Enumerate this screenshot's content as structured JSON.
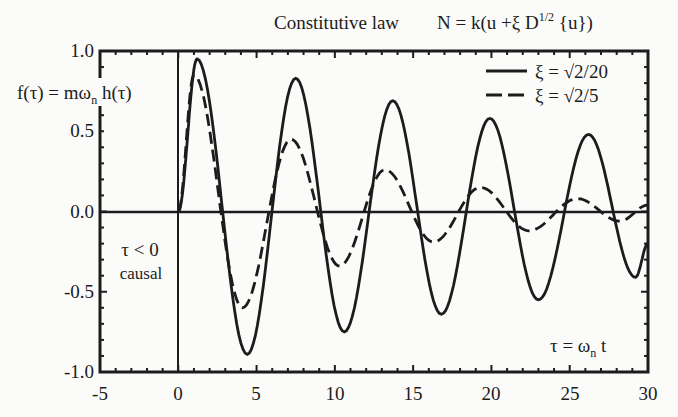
{
  "chart_data": {
    "type": "line",
    "title": "Constitutive law",
    "equation": "N = k(u + ξ D^{1/2}{u})",
    "xlabel": "τ = ω_n t",
    "ylabel": "f(τ) = m ω_n h(τ)",
    "xlim": [
      -5,
      30
    ],
    "ylim": [
      -1.0,
      1.0
    ],
    "x_ticks": [
      "-5",
      "0",
      "5",
      "10",
      "15",
      "20",
      "25",
      "30"
    ],
    "y_ticks": [
      "1.0",
      "0.5",
      "0.0",
      "-0.5",
      "-1.0"
    ],
    "grid": false,
    "legend_position": "upper right",
    "annotations": [
      "τ < 0",
      "causal"
    ],
    "series": [
      {
        "name": "ξ = √2/20",
        "style": "solid",
        "extrema": [
          [
            0,
            0
          ],
          [
            1.2,
            0.95
          ],
          [
            4.4,
            -0.89
          ],
          [
            7.5,
            0.83
          ],
          [
            10.6,
            -0.75
          ],
          [
            13.7,
            0.69
          ],
          [
            16.8,
            -0.64
          ],
          [
            19.9,
            0.58
          ],
          [
            23.0,
            -0.55
          ],
          [
            26.2,
            0.48
          ],
          [
            29.2,
            -0.41
          ],
          [
            30,
            -0.2
          ]
        ]
      },
      {
        "name": "ξ = √2/5",
        "style": "dashed",
        "extrema": [
          [
            0,
            0
          ],
          [
            1.0,
            0.85
          ],
          [
            4.1,
            -0.6
          ],
          [
            7.2,
            0.45
          ],
          [
            10.3,
            -0.34
          ],
          [
            13.2,
            0.26
          ],
          [
            16.3,
            -0.19
          ],
          [
            19.3,
            0.15
          ],
          [
            22.4,
            -0.12
          ],
          [
            25.5,
            0.08
          ],
          [
            28.2,
            -0.06
          ],
          [
            30,
            0.04
          ]
        ]
      }
    ]
  },
  "labels": {
    "title": "Constitutive law",
    "eq_prefix": "N = k(u +ξ D",
    "eq_exp": "1/2",
    "eq_suffix": " {u})",
    "ylabel_main": "f(τ) = mω",
    "ylabel_sub": "n",
    "ylabel_end": " h(τ)",
    "xlabel_main": "τ = ω",
    "xlabel_sub": "n",
    "xlabel_end": " t",
    "legend1": "ξ = √2/20",
    "legend2": "ξ = √2/5",
    "annot1": "τ < 0",
    "annot2": "causal",
    "yt": [
      "1.0",
      "0.5",
      "0.0",
      "-0.5",
      "-1.0"
    ],
    "xt": [
      "-5",
      "0",
      "5",
      "10",
      "15",
      "20",
      "25",
      "30"
    ]
  }
}
